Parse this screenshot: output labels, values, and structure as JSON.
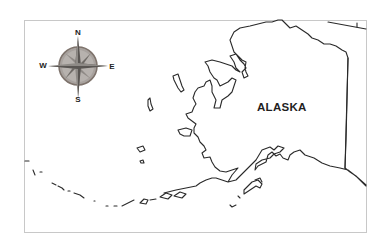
{
  "map": {
    "title": "Alaska outline map",
    "region_label": "ALASKA",
    "compass": {
      "north": "N",
      "south": "S",
      "east": "E",
      "west": "W",
      "icon": "compass-rose-icon"
    },
    "colors": {
      "outline": "#2a2a2a",
      "frame": "#c8c8c8",
      "compass_fill": "#8a8a8a",
      "compass_ring": "#a89a92",
      "background": "#ffffff"
    }
  }
}
